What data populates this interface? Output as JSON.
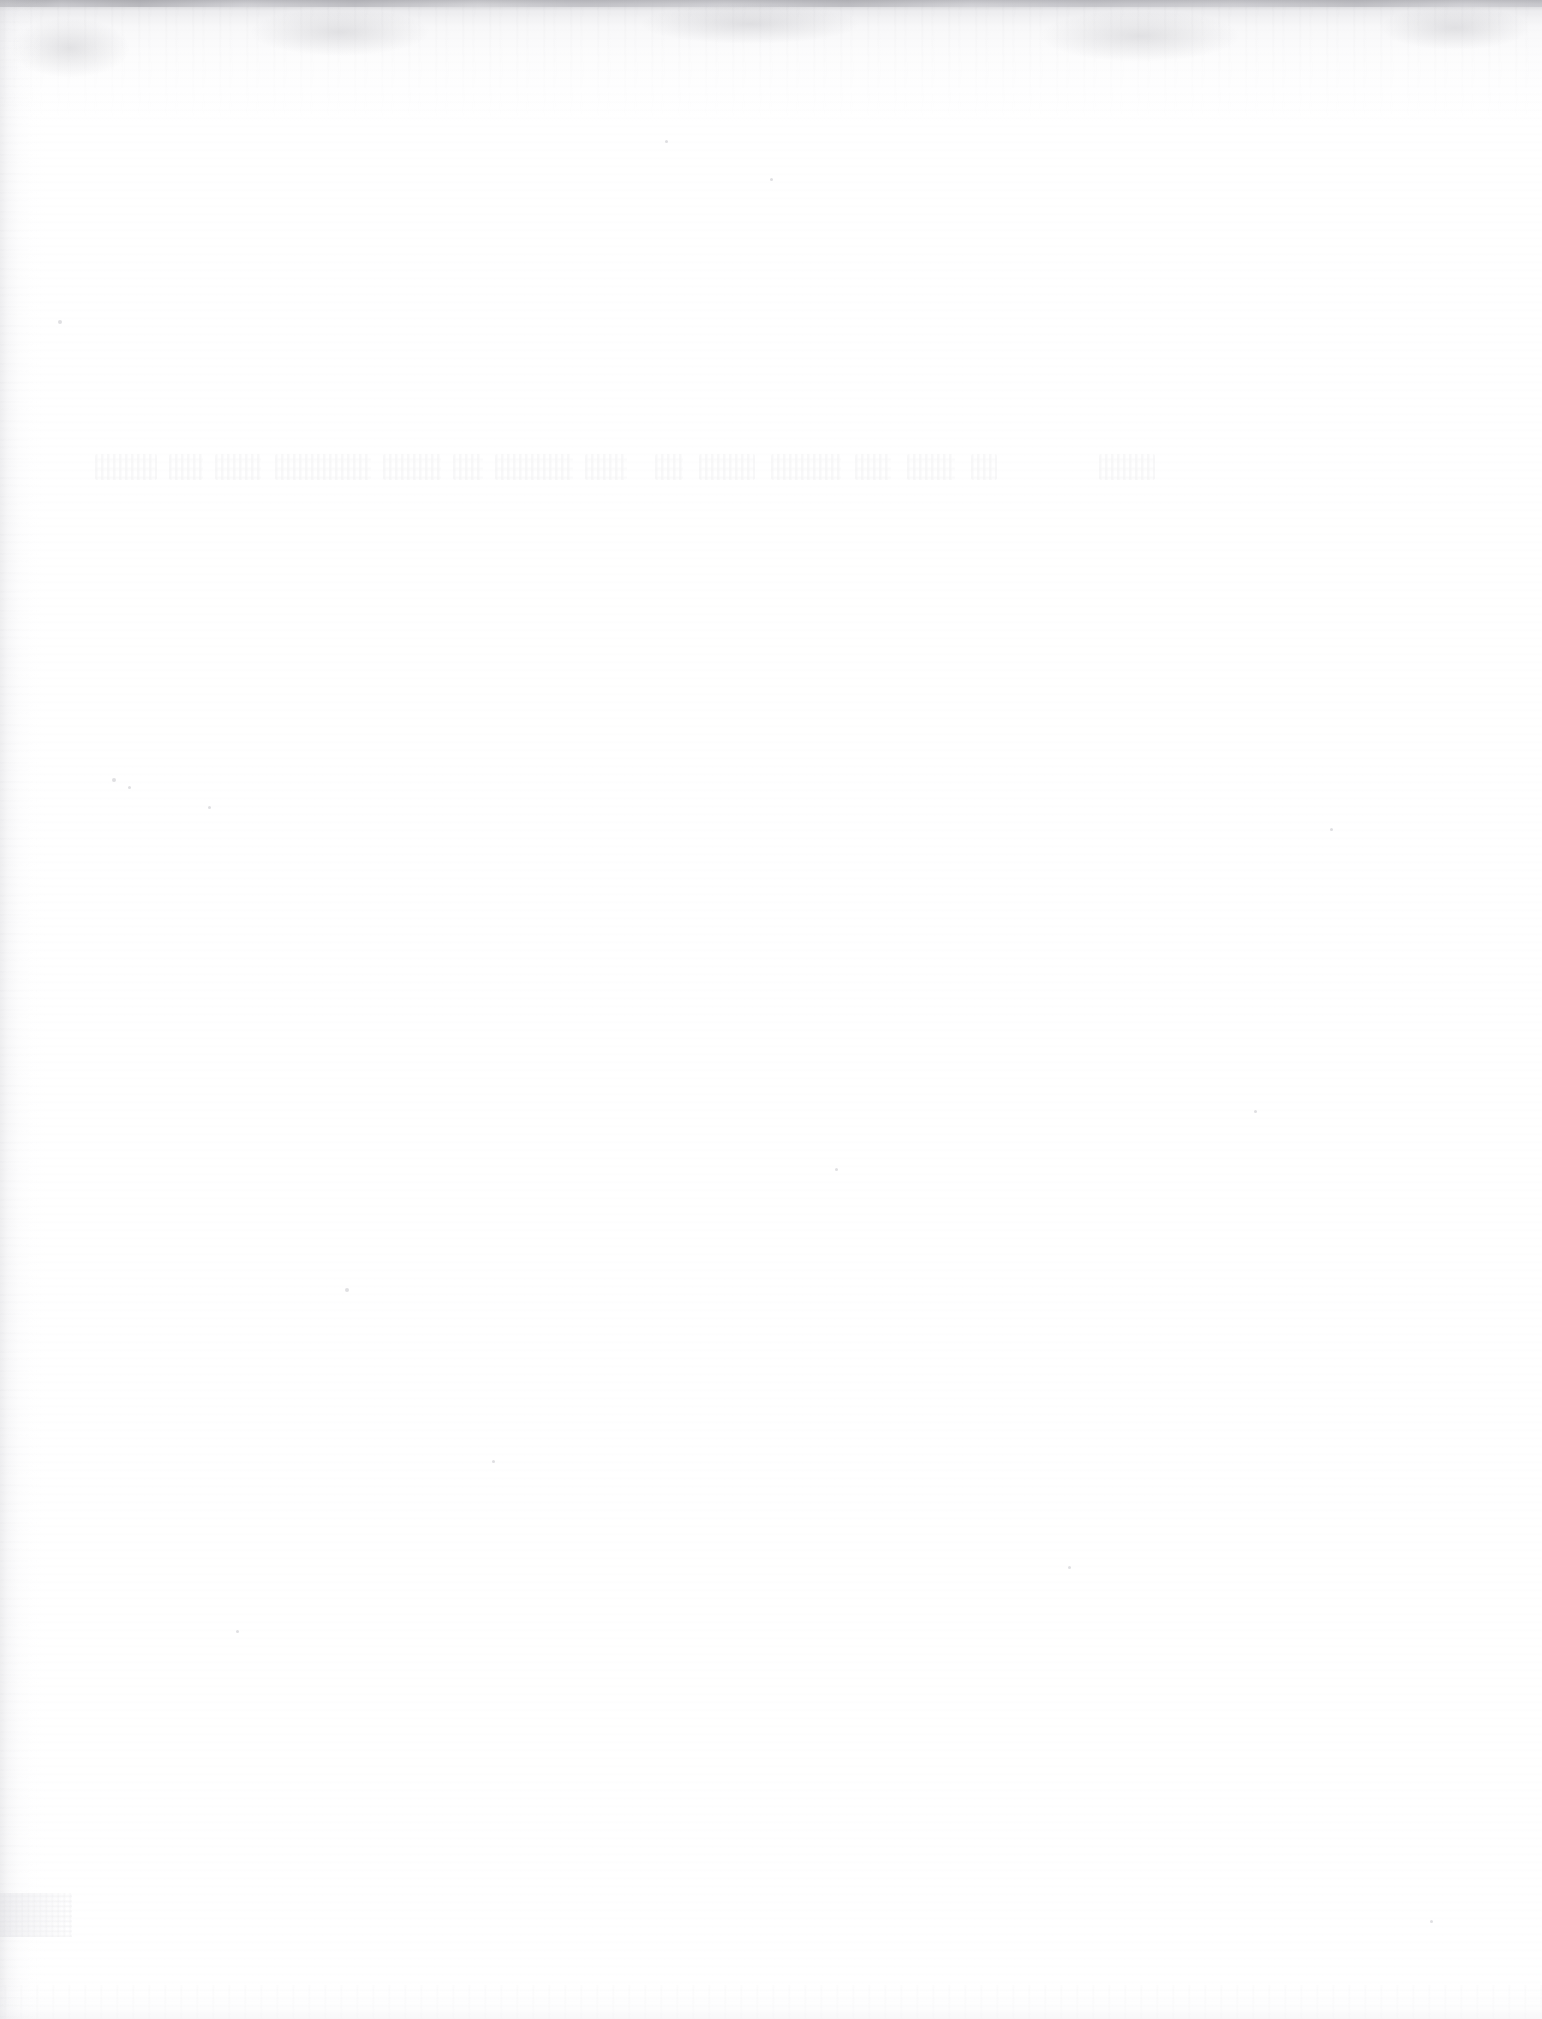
{
  "document": {
    "kind": "scanned-page",
    "page_state": "blank",
    "page_width": 1542,
    "page_height": 2019,
    "visible_text": "",
    "note_no_legible_content": "No legible text, headings, figures, tables or UI controls are present in the pixels.",
    "paper_color": "#ffffff"
  },
  "artifacts": {
    "top_band": {
      "name": "scanner-edge-band",
      "top": 0,
      "height": 124,
      "darkest_color": "#b0b0b4",
      "fade_to_color": "#ffffff"
    },
    "top_hairline": {
      "name": "scan-top-hairline",
      "height": 7,
      "color": "#96969c"
    },
    "left_gutter": {
      "name": "binding-gutter-stripe",
      "left": 0,
      "width": 46,
      "color": "#d6d6da"
    },
    "bottom_edge": {
      "name": "bottom-edge-noise",
      "height": 34,
      "color": "#e2e2e6"
    },
    "corner_patch": {
      "name": "bottom-left-gray-patch",
      "left": 0,
      "top": 1893,
      "width": 72,
      "height": 44,
      "color": "#dedee3"
    },
    "ghost_line": {
      "name": "ghost-text-bleedthrough",
      "left": 95,
      "top": 448,
      "width": 1060,
      "height": 44,
      "legible": false,
      "transcription": "",
      "ink_color": "#78788 0"
    },
    "smudges": [
      {
        "left": 10,
        "top": 18,
        "width": 120,
        "height": 60
      },
      {
        "left": 250,
        "top": 8,
        "width": 180,
        "height": 48
      },
      {
        "left": 640,
        "top": 4,
        "width": 220,
        "height": 40
      },
      {
        "left": 1040,
        "top": 10,
        "width": 200,
        "height": 52
      },
      {
        "left": 1380,
        "top": 6,
        "width": 150,
        "height": 44
      }
    ],
    "ghost_words": [
      {
        "left": 0,
        "width": 62
      },
      {
        "left": 74,
        "width": 34
      },
      {
        "left": 120,
        "width": 46
      },
      {
        "left": 180,
        "width": 96
      },
      {
        "left": 288,
        "width": 58
      },
      {
        "left": 358,
        "width": 30
      },
      {
        "left": 400,
        "width": 78
      },
      {
        "left": 490,
        "width": 42
      },
      {
        "left": 560,
        "width": 28
      },
      {
        "left": 604,
        "width": 56
      },
      {
        "left": 676,
        "width": 70
      },
      {
        "left": 760,
        "width": 36
      },
      {
        "left": 812,
        "width": 48
      },
      {
        "left": 876,
        "width": 26
      },
      {
        "left": 1004,
        "width": 56
      }
    ],
    "specks": [
      {
        "left": 112,
        "top": 778,
        "size": 4
      },
      {
        "left": 128,
        "top": 786,
        "size": 3
      },
      {
        "left": 208,
        "top": 806,
        "size": 3
      },
      {
        "left": 345,
        "top": 1288,
        "size": 4
      },
      {
        "left": 770,
        "top": 178,
        "size": 3
      },
      {
        "left": 665,
        "top": 140,
        "size": 3
      },
      {
        "left": 1254,
        "top": 1110,
        "size": 3
      },
      {
        "left": 835,
        "top": 1168,
        "size": 3
      },
      {
        "left": 492,
        "top": 1460,
        "size": 3
      },
      {
        "left": 1068,
        "top": 1566,
        "size": 3
      },
      {
        "left": 236,
        "top": 1630,
        "size": 3
      },
      {
        "left": 1330,
        "top": 828,
        "size": 3
      },
      {
        "left": 1430,
        "top": 1920,
        "size": 3
      },
      {
        "left": 58,
        "top": 320,
        "size": 4
      }
    ]
  }
}
